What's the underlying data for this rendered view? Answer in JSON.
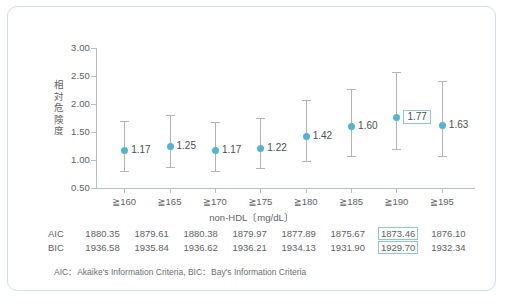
{
  "chart_data": {
    "type": "scatter",
    "title": "",
    "xlabel": "non-HDL〔mg/dL〕",
    "ylabel": "相対危険度",
    "categories": [
      "≧160",
      "≧165",
      "≧170",
      "≧175",
      "≧180",
      "≧185",
      "≧190",
      "≧195"
    ],
    "values": [
      1.17,
      1.25,
      1.17,
      1.22,
      1.42,
      1.6,
      1.77,
      1.63
    ],
    "point_labels": [
      "1.17",
      "1.25",
      "1.17",
      "1.22",
      "1.42",
      "1.60",
      "1.77",
      "1.63"
    ],
    "ci_low": [
      0.81,
      0.87,
      0.81,
      0.86,
      0.98,
      1.08,
      1.19,
      1.07
    ],
    "ci_high": [
      1.69,
      1.8,
      1.68,
      1.75,
      2.07,
      2.26,
      2.58,
      2.41
    ],
    "highlight_index": 6,
    "ylim": [
      0.5,
      3.0
    ],
    "yticks": [
      3.0,
      2.5,
      2.0,
      1.5,
      1.0,
      0.5
    ],
    "ytick_labels": [
      "3.00",
      "2.50",
      "2.00",
      "1.50",
      "1.00",
      "0.50"
    ],
    "grid": false,
    "legend": "none",
    "marker_color": "#53b4d2",
    "errorbar_color": "#b0b5b9",
    "highlight_border_color": "#8fc8de"
  },
  "table": {
    "rows": [
      {
        "label": "AIC",
        "values": [
          "1880.35",
          "1879.61",
          "1880.38",
          "1879.97",
          "1877.89",
          "1875.67",
          "1873.46",
          "1876.10"
        ],
        "highlight_index": 6
      },
      {
        "label": "BIC",
        "values": [
          "1936.58",
          "1935.84",
          "1936.62",
          "1936.21",
          "1934.13",
          "1931.90",
          "1929.70",
          "1932.34"
        ],
        "highlight_index": 6
      }
    ]
  },
  "footnote": "AIC：Akaike's Information Criteria,  BIC：Bay's Information Criteria",
  "card": {
    "border_color": "#cfe0e8",
    "background": "#ffffff"
  }
}
